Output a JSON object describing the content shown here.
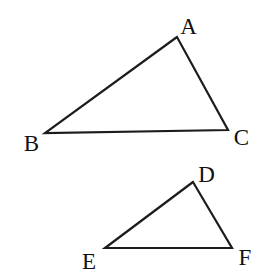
{
  "figure": {
    "background": "#ffffff",
    "line_color": "#1c1c1c",
    "line_width": "2.2",
    "label_color": "#111111",
    "triangle_large": {
      "id": "ABC",
      "points": "177,37 45,133 228,130"
    },
    "triangle_small": {
      "id": "DEF",
      "points": "193,182 105,248 232,248"
    },
    "labels": {
      "A": "A",
      "B": "B",
      "C": "C",
      "D": "D",
      "E": "E",
      "F": "F"
    }
  }
}
